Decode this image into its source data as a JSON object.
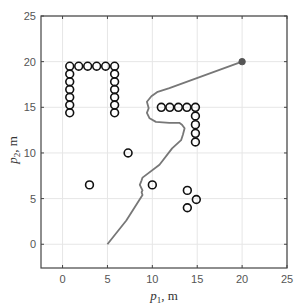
{
  "chart_data": {
    "type": "scatter",
    "title": "",
    "xlabel": {
      "var": "p",
      "sub": "1",
      "unit": ", m"
    },
    "ylabel": {
      "var": "p",
      "sub": "2",
      "unit": ", m"
    },
    "xlim": [
      -2.4,
      25
    ],
    "ylim": [
      -2.6,
      25
    ],
    "xticks": [
      0,
      5,
      10,
      15,
      20,
      25
    ],
    "yticks": [
      0,
      5,
      10,
      15,
      20,
      25
    ],
    "xtick_labels": [
      "0",
      "5",
      "10",
      "15",
      "20",
      "25"
    ],
    "ytick_labels": [
      "0",
      "5",
      "10",
      "15",
      "20",
      "25"
    ],
    "grid": true,
    "legend": null,
    "colors": {
      "axis": "#444444",
      "grid": "#e6e6e6",
      "path": "#777777",
      "obstacle": "#111111",
      "goal": "#555555"
    },
    "series": [
      {
        "name": "trajectory",
        "kind": "line",
        "points": [
          [
            5.0,
            0.0
          ],
          [
            7.1,
            2.6
          ],
          [
            8.9,
            5.4
          ],
          [
            8.8,
            5.7
          ],
          [
            8.9,
            5.9
          ],
          [
            8.6,
            6.5
          ],
          [
            8.8,
            7.0
          ],
          [
            8.9,
            7.3
          ],
          [
            10.8,
            8.7
          ],
          [
            12.2,
            10.5
          ],
          [
            13.2,
            11.4
          ],
          [
            13.4,
            12.0
          ],
          [
            13.6,
            12.7
          ],
          [
            13.3,
            13.1
          ],
          [
            13.0,
            13.3
          ],
          [
            11.9,
            13.3
          ],
          [
            10.4,
            13.4
          ],
          [
            9.7,
            13.8
          ],
          [
            9.4,
            14.4
          ],
          [
            9.6,
            14.9
          ],
          [
            9.4,
            15.6
          ],
          [
            9.9,
            16.2
          ],
          [
            10.6,
            16.7
          ],
          [
            11.9,
            17.1
          ],
          [
            20.0,
            20.0
          ]
        ]
      },
      {
        "name": "goal",
        "kind": "filled-marker",
        "points": [
          [
            20.0,
            20.0
          ]
        ]
      },
      {
        "name": "obstacles",
        "kind": "open-circle",
        "points": [
          [
            0.8,
            19.5
          ],
          [
            0.8,
            18.65
          ],
          [
            0.8,
            17.8
          ],
          [
            0.8,
            16.95
          ],
          [
            0.8,
            16.1
          ],
          [
            0.8,
            15.25
          ],
          [
            0.8,
            14.4
          ],
          [
            1.8,
            19.5
          ],
          [
            2.8,
            19.5
          ],
          [
            3.8,
            19.5
          ],
          [
            4.8,
            19.5
          ],
          [
            5.8,
            19.5
          ],
          [
            5.8,
            18.65
          ],
          [
            5.8,
            17.8
          ],
          [
            5.8,
            16.95
          ],
          [
            5.8,
            16.1
          ],
          [
            5.8,
            15.25
          ],
          [
            5.8,
            14.4
          ],
          [
            11.0,
            15.0
          ],
          [
            11.95,
            15.0
          ],
          [
            12.9,
            15.0
          ],
          [
            13.85,
            15.0
          ],
          [
            14.8,
            15.0
          ],
          [
            14.8,
            14.05
          ],
          [
            14.8,
            13.1
          ],
          [
            14.8,
            12.15
          ],
          [
            14.8,
            11.2
          ],
          [
            7.3,
            10.0
          ],
          [
            3.0,
            6.5
          ],
          [
            10.0,
            6.5
          ],
          [
            13.9,
            5.9
          ],
          [
            14.9,
            4.9
          ],
          [
            13.9,
            4.0
          ]
        ]
      }
    ]
  }
}
